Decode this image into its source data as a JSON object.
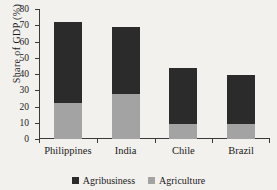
{
  "chart_data": {
    "type": "bar",
    "title": "",
    "subtitle": "",
    "xlabel": "",
    "ylabel": "Share of GDP (%)",
    "ylim": [
      0,
      80
    ],
    "yticks": [
      0,
      10,
      20,
      30,
      40,
      50,
      60,
      70,
      80
    ],
    "ytick_labels": [
      "0",
      "10",
      "20",
      "30",
      "40",
      "50",
      "60",
      "70",
      "80"
    ],
    "grid": false,
    "stacked": true,
    "legend_position": "bottom",
    "categories": [
      "Philippines",
      "India",
      "Chile",
      "Brazil"
    ],
    "series": [
      {
        "name": "Agriculture",
        "color": "#a3a3a3",
        "values": [
          22,
          28,
          9.5,
          9
        ]
      },
      {
        "name": "Agribusiness",
        "color": "#2b2b2b",
        "values": [
          50,
          41,
          34.5,
          30.5
        ]
      }
    ],
    "totals": [
      72,
      69,
      44,
      39.5
    ]
  },
  "axis": {
    "y_title": "Share of GDP (%)"
  },
  "legend": {
    "entries": [
      {
        "label": "Agribusiness",
        "swatch": "legend-swatch-agribusiness"
      },
      {
        "label": "Agriculture",
        "swatch": "legend-swatch-agriculture"
      }
    ]
  }
}
